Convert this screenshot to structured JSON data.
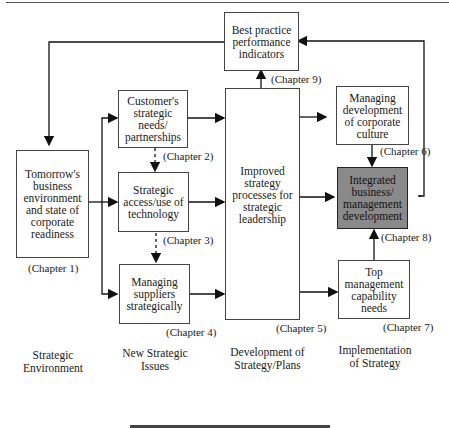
{
  "boxes": {
    "tomorrow": "Tomorrow's business environment and state of corporate readiness",
    "customer": "Customer's strategic needs/ partnerships",
    "access": "Strategic access/use of technology",
    "suppliers": "Managing suppliers strategically",
    "improved": "Improved strategy processes for strategic leadership",
    "best": "Best practice performance indicators",
    "culture": "Managing development of corporate culture",
    "integrated": "Integrated business/ management development",
    "topmgmt": "Top management capability needs"
  },
  "chapters": {
    "c1": "(Chapter 1)",
    "c2": "(Chapter 2)",
    "c3": "(Chapter 3)",
    "c4": "(Chapter 4)",
    "c5": "(Chapter 5)",
    "c6": "(Chapter 6)",
    "c7": "(Chapter 7)",
    "c8": "(Chapter 8)",
    "c9": "(Chapter 9)"
  },
  "columns": {
    "env": "Strategic Environment",
    "issues": "New Strategic Issues",
    "dev": "Development of Strategy/Plans",
    "impl": "Implementation of Strategy"
  },
  "colors": {
    "highlight": "#8a8a8a",
    "line": "#111111"
  }
}
